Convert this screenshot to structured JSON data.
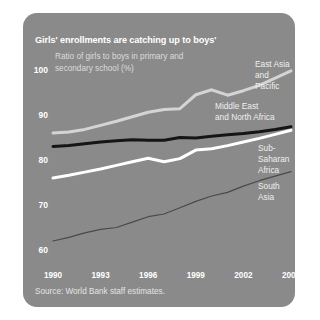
{
  "panel": {
    "background_color": "#8a8a8a",
    "title": "Girls' enrollments are catching up to boys'",
    "subtitle": "Ratio of girls to boys in primary\nand secondary school (%)",
    "source": "Source: World Bank staff estimates."
  },
  "chart_data": {
    "type": "line",
    "title": "Girls' enrollments are catching up to boys'",
    "subtitle": "Ratio of girls to boys in primary and secondary school (%)",
    "xlabel": "",
    "ylabel": "Ratio of girls to boys in primary and secondary school (%)",
    "xlim": [
      1990,
      2005
    ],
    "ylim": [
      60,
      100
    ],
    "yticks": [
      60,
      70,
      80,
      90,
      100
    ],
    "xticks": [
      1990,
      1993,
      1996,
      1999,
      2002,
      2005
    ],
    "grid": false,
    "legend": "inline-annotations",
    "x": [
      1990,
      1991,
      1992,
      1993,
      1994,
      1995,
      1996,
      1997,
      1998,
      1999,
      2000,
      2001,
      2002,
      2003,
      2004,
      2005
    ],
    "series": [
      {
        "name": "East Asia and Pacific",
        "color": "#d4d4d4",
        "width": 3,
        "values": [
          86.0,
          86.2,
          86.8,
          87.7,
          88.6,
          89.6,
          90.6,
          91.2,
          91.4,
          94.5,
          95.6,
          94.4,
          95.4,
          96.6,
          98.2,
          99.8
        ]
      },
      {
        "name": "Middle East and North Africa",
        "color": "#151515",
        "width": 3,
        "values": [
          83.0,
          83.2,
          83.6,
          84.0,
          84.3,
          84.5,
          84.4,
          84.4,
          85.0,
          84.9,
          85.3,
          85.6,
          85.9,
          86.3,
          86.8,
          87.4
        ]
      },
      {
        "name": "Sub-Saharan Africa",
        "color": "#ffffff",
        "width": 3,
        "values": [
          76.0,
          76.6,
          77.3,
          78.0,
          78.8,
          79.6,
          80.4,
          79.6,
          80.3,
          82.2,
          82.5,
          83.2,
          84.0,
          84.8,
          85.7,
          86.6
        ]
      },
      {
        "name": "South Asia",
        "color": "#4a4a4a",
        "width": 1.2,
        "values": [
          62.0,
          62.8,
          63.8,
          64.6,
          65.0,
          66.2,
          67.4,
          68.0,
          69.4,
          70.8,
          72.0,
          72.8,
          74.2,
          75.4,
          76.4,
          77.4
        ]
      }
    ],
    "annotations": [
      {
        "text": "East Asia\nand Pacific",
        "x_px": 232,
        "y_px": 46
      },
      {
        "text": "Middle East\nand North Africa",
        "x_px": 192,
        "y_px": 88
      },
      {
        "text": "Sub-Saharan\nAfrica",
        "x_px": 235,
        "y_px": 130
      },
      {
        "text": "South Asia",
        "x_px": 235,
        "y_px": 168
      }
    ]
  }
}
